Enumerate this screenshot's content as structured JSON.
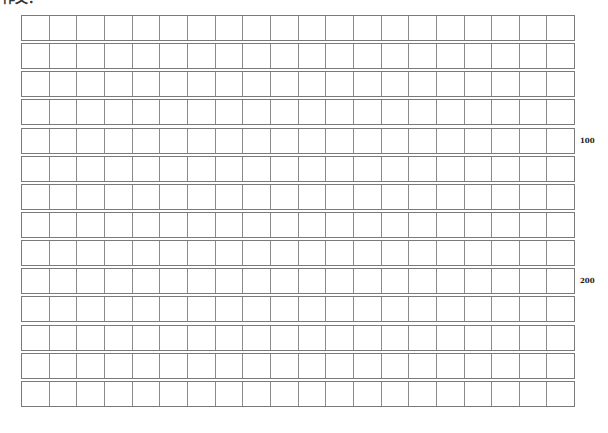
{
  "page": {
    "heading": "作文："
  },
  "grid": {
    "rows": 14,
    "columns": 20,
    "row_pitch_px": 28.14,
    "cell_height_px": 26,
    "line_color": "#7a7a7a"
  },
  "markers": [
    {
      "label": "100",
      "after_row": 5
    },
    {
      "label": "200",
      "after_row": 10
    }
  ]
}
